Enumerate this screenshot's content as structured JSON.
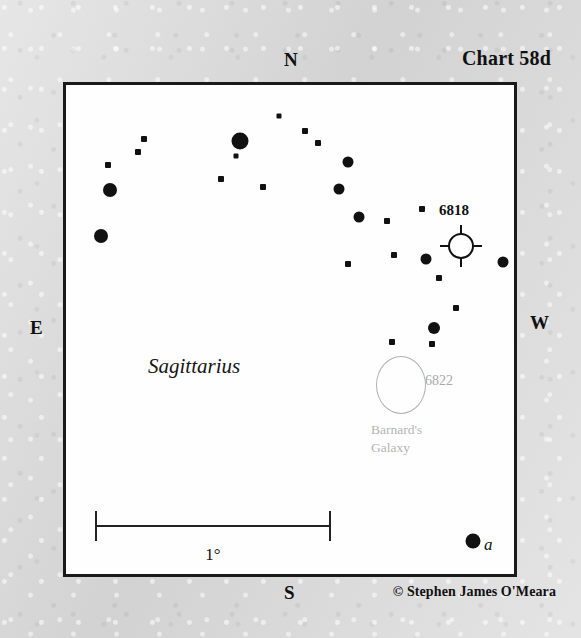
{
  "chart": {
    "title": "Chart 58d",
    "constellation": "Sagittarius",
    "copyright": "© Stephen James O'Meara",
    "background_color": "#d9d9d9",
    "field_color": "#fefefe",
    "frame_color": "#1a1a1a",
    "star_color": "#111111",
    "galaxy_outline_color": "#b0b0b0",
    "galaxy_label_color": "#b4b4b4"
  },
  "cardinals": {
    "north": "N",
    "south": "S",
    "east": "E",
    "west": "W"
  },
  "scale": {
    "label": "1°",
    "bar_start_x": 95,
    "bar_end_x": 331,
    "bar_y": 525
  },
  "objects": [
    {
      "name": "NGC 6818",
      "label": "6818",
      "type": "planetary-nebula",
      "symbol": "circle-with-cross-ticks",
      "x": 458,
      "y": 243,
      "radius": 12,
      "label_x": 446,
      "label_y": 202
    },
    {
      "name": "NGC 6822",
      "label": "6822",
      "common_name_line1": "Barnard's",
      "common_name_line2": "Galaxy",
      "type": "galaxy",
      "symbol": "open-ellipse",
      "x": 398,
      "y": 382,
      "rx": 24,
      "ry": 28,
      "label_x": 426,
      "label_y": 374,
      "name_x": 371,
      "name_y": 422
    }
  ],
  "labeled_stars": [
    {
      "label": "a",
      "style": "italic",
      "x": 470,
      "y": 538,
      "size": 15,
      "label_x": 484,
      "label_y": 545
    }
  ],
  "stars": [
    {
      "x": 276,
      "y": 113,
      "size": 5,
      "shape": "square"
    },
    {
      "x": 237,
      "y": 138,
      "size": 17,
      "shape": "round"
    },
    {
      "x": 141,
      "y": 136,
      "size": 6,
      "shape": "square"
    },
    {
      "x": 135,
      "y": 149,
      "size": 6,
      "shape": "square"
    },
    {
      "x": 233,
      "y": 153,
      "size": 5,
      "shape": "square"
    },
    {
      "x": 105,
      "y": 162,
      "size": 6,
      "shape": "square"
    },
    {
      "x": 218,
      "y": 176,
      "size": 6,
      "shape": "square"
    },
    {
      "x": 107,
      "y": 187,
      "size": 14,
      "shape": "round"
    },
    {
      "x": 260,
      "y": 184,
      "size": 6,
      "shape": "square"
    },
    {
      "x": 98,
      "y": 233,
      "size": 14,
      "shape": "round"
    },
    {
      "x": 302,
      "y": 128,
      "size": 6,
      "shape": "square"
    },
    {
      "x": 315,
      "y": 140,
      "size": 6,
      "shape": "square"
    },
    {
      "x": 345,
      "y": 159,
      "size": 11,
      "shape": "round"
    },
    {
      "x": 336,
      "y": 186,
      "size": 11,
      "shape": "round"
    },
    {
      "x": 356,
      "y": 214,
      "size": 11,
      "shape": "round"
    },
    {
      "x": 384,
      "y": 218,
      "size": 6,
      "shape": "square"
    },
    {
      "x": 419,
      "y": 206,
      "size": 6,
      "shape": "square"
    },
    {
      "x": 391,
      "y": 252,
      "size": 6,
      "shape": "square"
    },
    {
      "x": 423,
      "y": 256,
      "size": 11,
      "shape": "round"
    },
    {
      "x": 500,
      "y": 259,
      "size": 11,
      "shape": "round"
    },
    {
      "x": 436,
      "y": 275,
      "size": 6,
      "shape": "square"
    },
    {
      "x": 453,
      "y": 305,
      "size": 6,
      "shape": "square"
    },
    {
      "x": 431,
      "y": 325,
      "size": 12,
      "shape": "round"
    },
    {
      "x": 389,
      "y": 339,
      "size": 6,
      "shape": "square"
    },
    {
      "x": 429,
      "y": 341,
      "size": 6,
      "shape": "square"
    },
    {
      "x": 345,
      "y": 261,
      "size": 6,
      "shape": "square"
    }
  ]
}
